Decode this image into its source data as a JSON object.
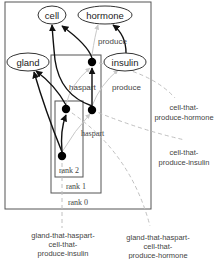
{
  "diagram": {
    "type": "nested-rank-concept-graph",
    "colors": {
      "box": "#555555",
      "edge_strong": "#111111",
      "edge_light": "#c8c8c8",
      "edge_dashed": "#c0c0c0",
      "text": "#222222",
      "dot": "#000000"
    },
    "nodes": {
      "cell": "cell",
      "hormone": "hormone",
      "gland": "gland",
      "insulin": "insulin"
    },
    "edge_labels": {
      "produce_top": "produce",
      "haspart_mid": "haspart",
      "produce_mid": "produce",
      "haspart_low": "haspart"
    },
    "ranks": {
      "rank0": "rank 0",
      "rank1": "rank 1",
      "rank2": "rank 2"
    },
    "annotations": {
      "cell_produce_hormone": [
        "cell-that-",
        "produce-hormone"
      ],
      "cell_produce_insulin": [
        "cell-that-",
        "produce-insulin"
      ],
      "gland_insulin": [
        "gland-that-haspart-",
        "cell-that-",
        "produce-insulin"
      ],
      "gland_hormone": [
        "gland-that-haspart-",
        "cell-that-",
        "produce-hormone"
      ]
    }
  }
}
